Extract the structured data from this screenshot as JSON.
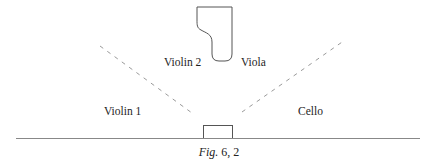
{
  "figure": {
    "caption_prefix": "Fig.",
    "caption_number": "6, 2"
  },
  "labels": {
    "violin1": "Violin 1",
    "violin2": "Violin 2",
    "viola": "Viola",
    "cello": "Cello"
  },
  "shapes": {
    "piano": "grand-piano-outline",
    "conductor": "conductor-podium-rectangle",
    "stage_front": "stage-baseline",
    "dividers": [
      "left-dashed-divider",
      "right-dashed-divider"
    ]
  },
  "colors": {
    "line": "#555555",
    "dash": "#9a9a9a",
    "text": "#1e1e1e"
  }
}
